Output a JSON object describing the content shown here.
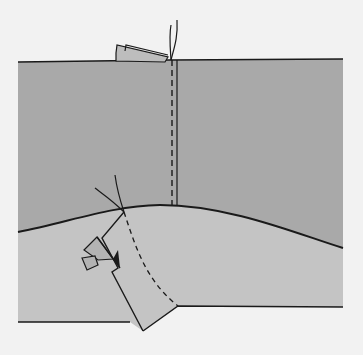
{
  "figure": {
    "title": "Sewing illustration: seam with folded corner",
    "colors": {
      "background": "#f2f2f2",
      "upper_fabric": "#a9a9a9",
      "lower_fabric": "#c4c4c4",
      "flap": "#bdbdbd",
      "line": "#1a1a1a"
    }
  }
}
